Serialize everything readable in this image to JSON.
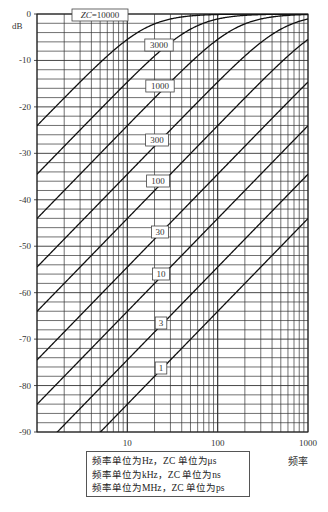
{
  "chart_data": {
    "type": "line",
    "title": "",
    "xlabel": "频率",
    "ylabel": "dB",
    "xscale": "log",
    "xlim": [
      1,
      1000
    ],
    "ylim": [
      -90,
      0
    ],
    "grid": true,
    "x_ticks": [
      "10",
      "100",
      "1000"
    ],
    "y_ticks": [
      "0",
      "-10",
      "-20",
      "-30",
      "-40",
      "-50",
      "-60",
      "-70",
      "-80",
      "-90"
    ],
    "formula": "dB = 20*log10(x/sqrt(1+x^2)), x = 2*pi*f*ZC*1e-6",
    "series": [
      {
        "name": "ZC=10000",
        "zc": 10000,
        "label": "ZC=10000",
        "points": [
          [
            1,
            -24.0
          ],
          [
            10,
            -5.4
          ],
          [
            100,
            -0.1
          ],
          [
            1000,
            0.0
          ]
        ]
      },
      {
        "name": "3000",
        "zc": 3000,
        "label": "3000",
        "points": [
          [
            1,
            -34.5
          ],
          [
            10,
            -14.6
          ],
          [
            100,
            -0.9
          ],
          [
            1000,
            0.0
          ]
        ]
      },
      {
        "name": "1000",
        "zc": 1000,
        "label": "1000",
        "points": [
          [
            1,
            -44.0
          ],
          [
            10,
            -24.0
          ],
          [
            100,
            -5.4
          ],
          [
            1000,
            -0.1
          ]
        ]
      },
      {
        "name": "300",
        "zc": 300,
        "label": "300",
        "points": [
          [
            1,
            -54.5
          ],
          [
            10,
            -34.5
          ],
          [
            100,
            -14.6
          ],
          [
            1000,
            -0.9
          ]
        ]
      },
      {
        "name": "100",
        "zc": 100,
        "label": "100",
        "points": [
          [
            1,
            -64.0
          ],
          [
            10,
            -44.0
          ],
          [
            100,
            -24.0
          ],
          [
            1000,
            -5.4
          ]
        ]
      },
      {
        "name": "30",
        "zc": 30,
        "label": "30",
        "points": [
          [
            1,
            -74.5
          ],
          [
            10,
            -54.5
          ],
          [
            100,
            -34.5
          ],
          [
            1000,
            -14.6
          ]
        ]
      },
      {
        "name": "10",
        "zc": 10,
        "label": "10",
        "points": [
          [
            1,
            -84.0
          ],
          [
            10,
            -64.0
          ],
          [
            100,
            -44.0
          ],
          [
            1000,
            -24.0
          ]
        ]
      },
      {
        "name": "3",
        "zc": 3,
        "label": "3",
        "points": [
          [
            1,
            -94.5
          ],
          [
            10,
            -74.5
          ],
          [
            100,
            -54.5
          ],
          [
            1000,
            -34.5
          ]
        ]
      },
      {
        "name": "1",
        "zc": 1,
        "label": "1",
        "points": [
          [
            10,
            -84.0
          ],
          [
            100,
            -64.0
          ],
          [
            1000,
            -44.0
          ]
        ]
      }
    ],
    "label_positions": [
      {
        "text": "ZC=10000",
        "x": 100,
        "y": 15
      },
      {
        "text": "3000",
        "x": 159,
        "y": 45
      },
      {
        "text": "1000",
        "x": 160,
        "y": 86
      },
      {
        "text": "300",
        "x": 157,
        "y": 140
      },
      {
        "text": "100",
        "x": 158,
        "y": 181
      },
      {
        "text": "30",
        "x": 160,
        "y": 232
      },
      {
        "text": "10",
        "x": 161,
        "y": 274
      },
      {
        "text": "3",
        "x": 161,
        "y": 323
      },
      {
        "text": "1",
        "x": 161,
        "y": 368
      }
    ],
    "legend": [
      "频率单位为Hz，ZC 单位为μs",
      "频率单位为kHz，ZC 单位为ns",
      "频率单位为MHz，ZC 单位为ps"
    ]
  },
  "note": {
    "line1": "频率单位为Hz，ZC 单位为μs",
    "line2": "频率单位为kHz，ZC 单位为ns",
    "line3": "频率单位为MHz，ZC 单位为ps"
  },
  "axis": {
    "x_unit": "频率",
    "y_unit": "dB"
  }
}
